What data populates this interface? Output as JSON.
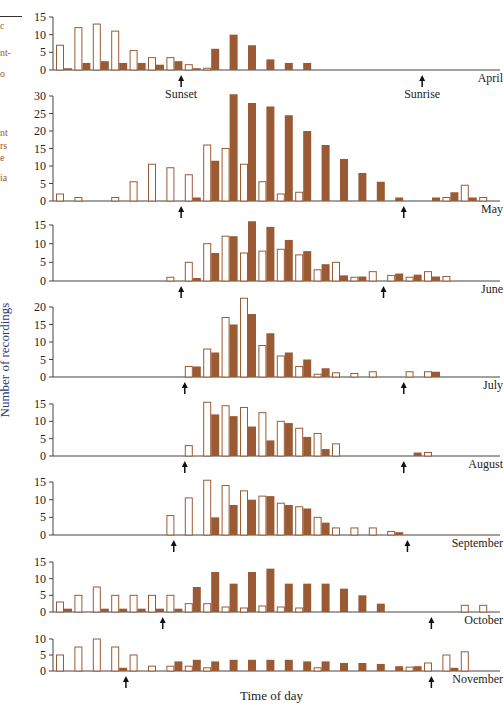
{
  "chart_data": {
    "type": "bar",
    "title": "",
    "xlabel": "Time of day",
    "ylabel": "Number of recordings",
    "legend": [
      {
        "name": "open",
        "style": "outlined bar"
      },
      {
        "name": "filled",
        "style": "solid brown bar"
      }
    ],
    "colors": {
      "filled": "#9a5a34",
      "open_stroke": "#9a5a34",
      "axis": "#444444",
      "ylabel": "#2b3a7a",
      "margin_text": "#9a5a2e"
    },
    "slots": 24,
    "annotations": {
      "sunset_label": "Sunset",
      "sunrise_label": "Sunrise"
    },
    "panels": [
      {
        "month": "April",
        "ymax": 15,
        "ticks": [
          0,
          5,
          10,
          15
        ],
        "open": [
          7,
          12,
          13,
          11,
          5.5,
          3.5,
          3.5,
          1.5,
          0.5,
          0,
          0,
          0,
          0,
          0,
          0,
          0,
          0,
          0,
          0,
          0,
          0,
          0,
          0,
          0
        ],
        "filled": [
          0.5,
          2,
          2.5,
          2,
          2,
          1.5,
          2.5,
          0.5,
          6,
          10,
          7,
          3,
          2,
          2,
          0,
          0,
          0,
          0,
          0,
          0,
          0,
          0,
          0,
          0
        ],
        "sunset_slot": 6.8,
        "sunrise_slot": 19.9
      },
      {
        "month": "May",
        "ymax": 30,
        "ticks": [
          0,
          5,
          10,
          15,
          20,
          25,
          30
        ],
        "open": [
          2,
          1,
          0,
          1,
          5.5,
          10.5,
          9.5,
          7.5,
          16,
          15,
          10.5,
          5.5,
          2,
          2.5,
          0,
          0,
          0,
          0,
          0,
          0,
          0,
          1,
          4.5,
          1
        ],
        "filled": [
          0,
          0,
          0,
          0,
          0,
          0,
          0,
          1,
          11.5,
          30.5,
          28,
          27,
          24.5,
          20,
          16,
          12,
          8,
          5.5,
          1,
          0,
          1,
          2.5,
          1,
          0
        ],
        "sunset_slot": 6.8,
        "sunrise_slot": 18.9
      },
      {
        "month": "June",
        "ymax": 15,
        "ticks": [
          0,
          5,
          10,
          15
        ],
        "open": [
          0,
          0,
          0,
          0,
          0,
          0,
          1,
          5,
          10,
          12,
          7.5,
          8,
          8.5,
          7,
          3,
          5,
          1,
          2.5,
          1.5,
          1,
          2.5,
          1.2,
          0,
          0
        ],
        "filled": [
          0,
          0,
          0,
          0,
          0,
          0,
          0,
          0.8,
          7.5,
          12,
          16,
          14.5,
          11,
          8,
          4.5,
          1.5,
          1.2,
          0,
          2,
          1.7,
          1.2,
          0,
          0,
          0
        ],
        "sunset_slot": 6.8,
        "sunrise_slot": 17.8
      },
      {
        "month": "July",
        "ymax": 20,
        "ticks": [
          0,
          5,
          10,
          15,
          20
        ],
        "open": [
          0,
          0,
          0,
          0,
          0,
          0,
          0,
          3,
          8,
          17,
          22.5,
          9,
          6,
          3,
          0.8,
          1.2,
          1,
          1.5,
          0,
          1.5,
          1.5,
          0,
          0,
          0
        ],
        "filled": [
          0,
          0,
          0,
          0,
          0,
          0,
          0,
          3,
          7,
          15,
          18,
          12.5,
          7,
          5,
          2.5,
          0,
          0,
          0,
          0,
          0,
          1.5,
          0,
          0,
          0
        ],
        "sunset_slot": 7.0,
        "sunrise_slot": 18.9
      },
      {
        "month": "August",
        "ymax": 15,
        "ticks": [
          0,
          5,
          10,
          15
        ],
        "open": [
          0,
          0,
          0,
          0,
          0,
          0,
          0,
          3,
          15.5,
          14.5,
          14,
          12.5,
          10,
          8,
          6.5,
          3.5,
          0,
          0,
          0,
          0,
          1,
          0,
          0,
          0
        ],
        "filled": [
          0,
          0,
          0,
          0,
          0,
          0,
          0,
          0,
          12,
          11.5,
          8.5,
          4.5,
          9.5,
          5.5,
          2,
          0,
          0,
          0,
          0,
          1,
          0,
          0,
          0,
          0
        ],
        "sunset_slot": 7.0,
        "sunrise_slot": 18.9
      },
      {
        "month": "September",
        "ymax": 15,
        "ticks": [
          0,
          5,
          10,
          15
        ],
        "open": [
          0,
          0,
          0,
          0,
          0,
          0,
          5.5,
          10.5,
          15.5,
          14,
          12.5,
          11,
          9,
          8,
          5,
          2,
          2,
          2,
          1,
          0,
          0,
          0,
          0,
          0
        ],
        "filled": [
          0,
          0,
          0,
          0,
          0,
          0,
          0,
          0,
          5,
          8.5,
          10,
          11,
          8.5,
          7.5,
          3.5,
          0,
          0,
          0,
          0.8,
          0,
          0,
          0,
          0,
          0
        ],
        "sunset_slot": 6.4,
        "sunrise_slot": 19.1
      },
      {
        "month": "October",
        "ymax": 15,
        "ticks": [
          0,
          5,
          10,
          15
        ],
        "open": [
          3,
          5,
          7.5,
          5,
          5,
          5,
          5,
          2.5,
          2.5,
          1.5,
          1.2,
          1.8,
          1.5,
          1.2,
          0,
          0,
          0,
          0,
          0,
          0,
          0,
          0,
          2,
          2
        ],
        "filled": [
          1,
          0,
          1,
          1,
          1,
          1,
          1,
          7.5,
          12,
          8.5,
          12,
          13,
          8.5,
          8.5,
          8.5,
          7,
          5,
          2.5,
          0,
          0,
          0,
          0,
          0,
          0
        ],
        "sunset_slot": 5.8,
        "sunrise_slot": 20.4
      },
      {
        "month": "November",
        "ymax": 10,
        "ticks": [
          0,
          5,
          10
        ],
        "open": [
          5,
          7.5,
          10,
          7.5,
          5,
          1.5,
          1.5,
          1.5,
          1,
          0,
          0,
          0,
          0,
          0,
          1,
          0,
          0,
          0,
          0,
          1.2,
          2.5,
          5,
          6,
          0
        ],
        "filled": [
          0,
          0,
          0,
          1,
          0,
          0,
          3,
          3.5,
          3,
          3.5,
          3.5,
          3.5,
          3.5,
          3,
          3,
          2.5,
          2.5,
          2.2,
          1.5,
          1.5,
          0,
          1,
          0,
          0
        ],
        "sunset_slot": 3.8,
        "sunrise_slot": 20.4
      }
    ]
  },
  "margin_fragments": [
    "c",
    "nt-",
    "o",
    "nt",
    "rs",
    "e",
    "ia"
  ]
}
